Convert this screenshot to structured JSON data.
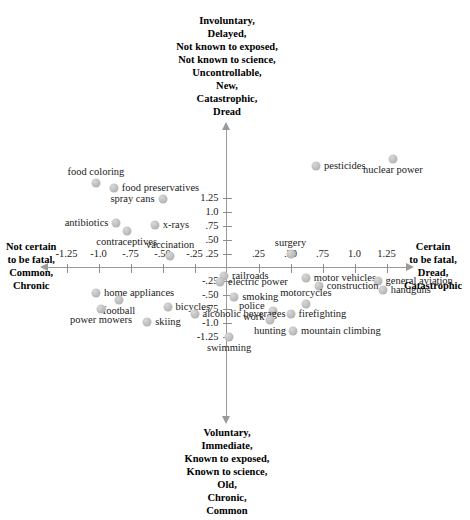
{
  "chart_data": {
    "type": "scatter",
    "title": "",
    "xlabel": "",
    "ylabel": "",
    "xlim": [
      -1.55,
      1.55
    ],
    "ylim": [
      -1.55,
      1.75
    ],
    "grid": false,
    "legend": null,
    "axis_poles": {
      "top": [
        "Involuntary,",
        "Delayed,",
        "Not known to exposed,",
        "Not known to science,",
        "Uncontrollable,",
        "New,",
        "Catastrophic,",
        "Dread"
      ],
      "bottom": [
        "Voluntary,",
        "Immediate,",
        "Known to exposed,",
        "Known to science,",
        "Old,",
        "Chronic,",
        "Common"
      ],
      "left": [
        "Not certain",
        "to be fatal,",
        "Common,",
        "Chronic"
      ],
      "right": [
        "Certain",
        "to be fatal,",
        "Dread,",
        "Catastrophic"
      ]
    },
    "xticks": [
      "-1.25",
      "-1.0",
      "-.75",
      "-.50",
      "-.25",
      ".25",
      ".50",
      ".75",
      "1.0",
      "1.25"
    ],
    "xtick_values": [
      -1.25,
      -1.0,
      -0.75,
      -0.5,
      -0.25,
      0.25,
      0.5,
      0.75,
      1.0,
      1.25
    ],
    "yticks": [
      "1.25",
      "1.0",
      ".75",
      ".50",
      ".25",
      "-.25",
      "-.50",
      "-.75",
      "-1.0",
      "-1.25"
    ],
    "ytick_values": [
      1.25,
      1.0,
      0.75,
      0.5,
      0.25,
      -0.25,
      -0.5,
      -0.75,
      -1.0,
      -1.25
    ],
    "point_color": "#bcbcbc",
    "points": [
      {
        "label": "nuclear power",
        "x": 1.3,
        "y": 1.95,
        "pos": "below"
      },
      {
        "label": "pesticides",
        "x": 0.7,
        "y": 1.82,
        "pos": "right"
      },
      {
        "label": "food coloring",
        "x": -1.02,
        "y": 1.52,
        "pos": "above"
      },
      {
        "label": "food preservatives",
        "x": -0.88,
        "y": 1.44,
        "pos": "right"
      },
      {
        "label": "spray cans",
        "x": -0.5,
        "y": 1.24,
        "pos": "left"
      },
      {
        "label": "antibiotics",
        "x": -0.86,
        "y": 0.8,
        "pos": "left"
      },
      {
        "label": "x-rays",
        "x": -0.56,
        "y": 0.76,
        "pos": "right"
      },
      {
        "label": "contraceptives",
        "x": -0.78,
        "y": 0.66,
        "pos": "below"
      },
      {
        "label": "vaccination",
        "x": -0.44,
        "y": 0.2,
        "pos": "above"
      },
      {
        "label": "surgery",
        "x": 0.5,
        "y": 0.24,
        "pos": "above"
      },
      {
        "label": "railroads",
        "x": -0.02,
        "y": -0.16,
        "pos": "right"
      },
      {
        "label": "electric power",
        "x": -0.05,
        "y": -0.26,
        "pos": "right"
      },
      {
        "label": "motor vehicles",
        "x": 0.62,
        "y": -0.19,
        "pos": "right"
      },
      {
        "label": "general aviation",
        "x": 1.18,
        "y": -0.24,
        "pos": "right"
      },
      {
        "label": "construction",
        "x": 0.72,
        "y": -0.34,
        "pos": "right"
      },
      {
        "label": "handguns",
        "x": 1.22,
        "y": -0.4,
        "pos": "right"
      },
      {
        "label": "smoking",
        "x": 0.06,
        "y": -0.54,
        "pos": "right"
      },
      {
        "label": "home appliances",
        "x": -1.02,
        "y": -0.46,
        "pos": "right"
      },
      {
        "label": "football",
        "x": -0.84,
        "y": -0.58,
        "pos": "below"
      },
      {
        "label": "motorcycles",
        "x": 0.62,
        "y": -0.66,
        "pos": "above"
      },
      {
        "label": "power mowers",
        "x": -0.98,
        "y": -0.74,
        "pos": "below"
      },
      {
        "label": "bicycles",
        "x": -0.46,
        "y": -0.72,
        "pos": "right"
      },
      {
        "label": "police work",
        "x": 0.36,
        "y": -0.78,
        "pos": "left"
      },
      {
        "label": "firefighting",
        "x": 0.5,
        "y": -0.84,
        "pos": "right"
      },
      {
        "label": "alcoholic beverages",
        "x": -0.25,
        "y": -0.84,
        "pos": "right"
      },
      {
        "label": "hunting",
        "x": 0.34,
        "y": -0.94,
        "pos": "below"
      },
      {
        "label": "skiing",
        "x": -0.62,
        "y": -0.98,
        "pos": "right"
      },
      {
        "label": "mountain climbing",
        "x": 0.52,
        "y": -1.14,
        "pos": "right"
      },
      {
        "label": "swimming",
        "x": 0.02,
        "y": -1.26,
        "pos": "below"
      }
    ]
  }
}
